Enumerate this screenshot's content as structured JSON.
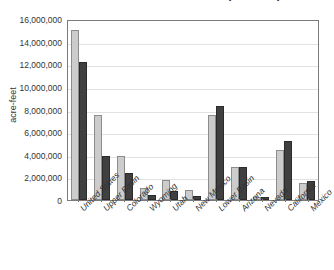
{
  "chart_data": {
    "type": "bar",
    "title": "Colorado River Water Use (acre-feet)",
    "xlabel": "",
    "ylabel": "acre-feet",
    "ylim": [
      0,
      16000000
    ],
    "ytick_step": 2000000,
    "ytick_labels": [
      "16,000,000",
      "14,000,000",
      "12,000,000",
      "10,000,000",
      "8,000,000",
      "6,000,000",
      "4,000,000",
      "2,000,000",
      "0"
    ],
    "ytick_values": [
      16000000,
      14000000,
      12000000,
      10000000,
      8000000,
      6000000,
      4000000,
      2000000,
      0
    ],
    "grid": true,
    "legend": "none",
    "categories": [
      "United States",
      "Upper Basin",
      "Colorado",
      "Wyoming",
      "Utah",
      "New Mexico",
      "Lower Basin",
      "Arizona",
      "Nevada",
      "California",
      "Mexico"
    ],
    "series": [
      {
        "name": "Series 1",
        "color": "#cccccc",
        "values": [
          15000000,
          7550000,
          3900000,
          1100000,
          1750000,
          850000,
          7500000,
          2900000,
          300000,
          4400000,
          1500000
        ]
      },
      {
        "name": "Series 2",
        "color": "#404040",
        "values": [
          12200000,
          3900000,
          2400000,
          400000,
          800000,
          350000,
          8300000,
          2900000,
          300000,
          5200000,
          1700000
        ]
      }
    ]
  },
  "axis": {
    "y_title": "acre-feet"
  },
  "colors": {
    "series_1": "#cccccc",
    "series_2": "#404040",
    "plot_border": "#7a7a7a",
    "gridline": "#e2e2e2",
    "background": "#ffffff"
  }
}
